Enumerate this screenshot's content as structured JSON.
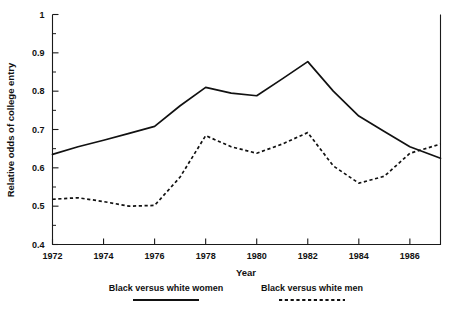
{
  "chart_data": {
    "type": "line",
    "title": "",
    "xlabel": "Year",
    "ylabel": "Relative odds of college entry",
    "xlim": [
      1972,
      1987.2
    ],
    "ylim": [
      0.4,
      1.0
    ],
    "grid": false,
    "legend_position": "bottom",
    "x_ticks": [
      1972,
      1974,
      1976,
      1978,
      1980,
      1982,
      1984,
      1986
    ],
    "x_tick_labels": [
      "1972",
      "1974",
      "1976",
      "1978",
      "1980",
      "1982",
      "1984",
      "1986"
    ],
    "x_minor_ticks": [
      1973,
      1975,
      1977,
      1979,
      1981,
      1983,
      1985,
      1987
    ],
    "y_ticks": [
      0.4,
      0.5,
      0.6,
      0.7,
      0.8,
      0.9,
      1.0
    ],
    "y_tick_labels": [
      "0.4",
      "0.5",
      "0.6",
      "0.7",
      "0.8",
      "0.9",
      "1"
    ],
    "y_minor_ticks": [
      0.45,
      0.55,
      0.65,
      0.75,
      0.85,
      0.95
    ],
    "x": [
      1972,
      1973,
      1974,
      1975,
      1976,
      1977,
      1978,
      1979,
      1980,
      1981,
      1982,
      1983,
      1984,
      1985,
      1986,
      1987.2
    ],
    "series": [
      {
        "name": "Black versus white women",
        "style": "solid",
        "color": "#111111",
        "values": [
          0.635,
          0.655,
          0.672,
          0.69,
          0.708,
          0.762,
          0.81,
          0.795,
          0.788,
          0.832,
          0.877,
          0.8,
          0.735,
          0.695,
          0.655,
          0.625
        ]
      },
      {
        "name": "Black versus white men",
        "style": "dashed",
        "color": "#111111",
        "values": [
          0.518,
          0.522,
          0.512,
          0.5,
          0.502,
          0.576,
          0.684,
          0.655,
          0.638,
          0.662,
          0.692,
          0.605,
          0.56,
          0.578,
          0.638,
          0.662
        ]
      }
    ]
  },
  "legend": {
    "items": [
      {
        "label": "Black versus white women",
        "style": "solid"
      },
      {
        "label": "Black versus white men",
        "style": "dashed"
      }
    ]
  }
}
